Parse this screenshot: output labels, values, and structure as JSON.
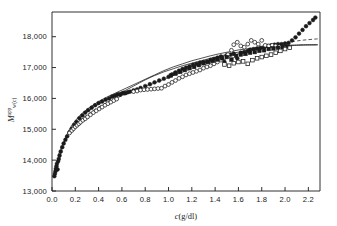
{
  "figure": {
    "background_color": "#ffffff",
    "ink_color": "#1a1a1a"
  },
  "chart_data": {
    "type": "scatter",
    "title": "",
    "subtitle": "",
    "xlabel": "c (g/dl)",
    "xlabel_italic_part": "c",
    "xlabel_rest": "(g/dl)",
    "ylabel": "M app w(c)",
    "ylabel_base": "M",
    "ylabel_sup": "app",
    "ylabel_sub": "w(c)",
    "xlim": [
      0.0,
      2.3
    ],
    "ylim": [
      13000,
      18800
    ],
    "grid": false,
    "legend_position": "none",
    "xticks": [
      "0.0",
      "0.2",
      "0.4",
      "0.6",
      "0.8",
      "1.0",
      "1.2",
      "1.4",
      "1.6",
      "1.8",
      "2.0",
      "2.2"
    ],
    "xtick_values": [
      0.0,
      0.2,
      0.4,
      0.6,
      0.8,
      1.0,
      1.2,
      1.4,
      1.6,
      1.8,
      2.0,
      2.2
    ],
    "yticks": [
      "13,000",
      "14,000",
      "15,000",
      "16,000",
      "17,000",
      "18,000"
    ],
    "ytick_values": [
      13000,
      14000,
      15000,
      16000,
      17000,
      18000
    ],
    "series": [
      {
        "name": "filled-circles",
        "marker": "filled-circle",
        "color": "#1a1a1a",
        "points": [
          [
            0.02,
            13480
          ],
          [
            0.025,
            13560
          ],
          [
            0.03,
            13640
          ],
          [
            0.033,
            13720
          ],
          [
            0.038,
            13800
          ],
          [
            0.042,
            13880
          ],
          [
            0.048,
            13700
          ],
          [
            0.052,
            13960
          ],
          [
            0.058,
            14040
          ],
          [
            0.065,
            14150
          ],
          [
            0.075,
            14280
          ],
          [
            0.088,
            14420
          ],
          [
            0.1,
            14540
          ],
          [
            0.115,
            14660
          ],
          [
            0.13,
            14770
          ],
          [
            0.15,
            14900
          ],
          [
            0.17,
            15020
          ],
          [
            0.19,
            15140
          ],
          [
            0.21,
            15240
          ],
          [
            0.235,
            15360
          ],
          [
            0.26,
            15450
          ],
          [
            0.285,
            15540
          ],
          [
            0.31,
            15620
          ],
          [
            0.34,
            15700
          ],
          [
            0.37,
            15780
          ],
          [
            0.4,
            15850
          ],
          [
            0.43,
            15900
          ],
          [
            0.46,
            15960
          ],
          [
            0.49,
            16000
          ],
          [
            0.515,
            16060
          ],
          [
            0.535,
            16080
          ],
          [
            0.555,
            16110
          ],
          [
            0.57,
            16140
          ],
          [
            0.585,
            16120
          ],
          [
            0.6,
            16160
          ],
          [
            0.615,
            16180
          ],
          [
            0.63,
            16170
          ],
          [
            0.65,
            16200
          ],
          [
            0.67,
            16220
          ],
          [
            0.7,
            16260
          ],
          [
            0.73,
            16290
          ],
          [
            0.76,
            16340
          ],
          [
            0.8,
            16400
          ],
          [
            0.84,
            16460
          ],
          [
            0.88,
            16520
          ],
          [
            0.92,
            16580
          ],
          [
            0.96,
            16640
          ],
          [
            1.0,
            16700
          ],
          [
            1.03,
            16780
          ],
          [
            1.06,
            16840
          ],
          [
            1.09,
            16900
          ],
          [
            1.12,
            16960
          ],
          [
            1.15,
            17000
          ],
          [
            1.18,
            17040
          ],
          [
            1.21,
            17090
          ],
          [
            1.24,
            17120
          ],
          [
            1.27,
            17160
          ],
          [
            1.3,
            17180
          ],
          [
            1.33,
            17200
          ],
          [
            1.36,
            17250
          ],
          [
            1.39,
            17280
          ],
          [
            1.42,
            17320
          ],
          [
            1.45,
            17360
          ],
          [
            1.48,
            17180
          ],
          [
            1.5,
            17400
          ],
          [
            1.53,
            17420
          ],
          [
            1.56,
            17450
          ],
          [
            1.59,
            17300
          ],
          [
            1.62,
            17480
          ],
          [
            1.65,
            17500
          ],
          [
            1.68,
            17540
          ],
          [
            1.7,
            17580
          ],
          [
            1.73,
            17600
          ],
          [
            1.76,
            17620
          ],
          [
            1.79,
            17640
          ],
          [
            1.82,
            17660
          ],
          [
            1.85,
            17700
          ],
          [
            1.88,
            17720
          ],
          [
            1.91,
            17740
          ],
          [
            1.94,
            17760
          ],
          [
            1.97,
            17760
          ],
          [
            2.0,
            17780
          ],
          [
            2.03,
            17800
          ],
          [
            2.06,
            17880
          ],
          [
            2.09,
            17980
          ],
          [
            2.12,
            18100
          ],
          [
            2.15,
            18220
          ],
          [
            2.18,
            18340
          ],
          [
            2.21,
            18440
          ],
          [
            2.24,
            18540
          ],
          [
            2.26,
            18620
          ]
        ]
      },
      {
        "name": "open-circles",
        "marker": "open-circle",
        "color": "#1a1a1a",
        "points": [
          [
            0.15,
            14880
          ],
          [
            0.17,
            14960
          ],
          [
            0.185,
            15020
          ],
          [
            0.2,
            15080
          ],
          [
            0.215,
            15130
          ],
          [
            0.23,
            15180
          ],
          [
            0.245,
            15230
          ],
          [
            0.265,
            15290
          ],
          [
            0.285,
            15340
          ],
          [
            0.305,
            15400
          ],
          [
            0.33,
            15470
          ],
          [
            0.355,
            15540
          ],
          [
            0.38,
            15600
          ],
          [
            0.405,
            15660
          ],
          [
            0.43,
            15720
          ],
          [
            0.455,
            15780
          ],
          [
            0.48,
            15830
          ],
          [
            0.505,
            15880
          ],
          [
            0.53,
            15930
          ],
          [
            0.555,
            15980
          ],
          [
            0.7,
            16220
          ],
          [
            0.73,
            16240
          ],
          [
            0.76,
            16270
          ],
          [
            0.79,
            16280
          ],
          [
            0.82,
            16290
          ],
          [
            0.85,
            16300
          ],
          [
            0.88,
            16310
          ],
          [
            0.91,
            16320
          ],
          [
            0.94,
            16330
          ],
          [
            0.97,
            16400
          ],
          [
            1.0,
            16450
          ],
          [
            1.03,
            16520
          ],
          [
            1.06,
            16580
          ],
          [
            1.09,
            16650
          ],
          [
            1.12,
            16700
          ],
          [
            1.15,
            16760
          ],
          [
            1.18,
            16800
          ],
          [
            1.21,
            16840
          ],
          [
            1.24,
            16880
          ],
          [
            1.27,
            16920
          ],
          [
            1.3,
            16980
          ],
          [
            1.33,
            17020
          ],
          [
            1.36,
            17060
          ],
          [
            1.39,
            17120
          ],
          [
            1.42,
            17180
          ],
          [
            1.45,
            17240
          ],
          [
            1.48,
            17320
          ],
          [
            1.51,
            17420
          ],
          [
            1.54,
            17560
          ],
          [
            1.56,
            17740
          ],
          [
            1.59,
            17820
          ],
          [
            1.62,
            17700
          ],
          [
            1.65,
            17660
          ],
          [
            1.68,
            17760
          ],
          [
            1.71,
            17880
          ],
          [
            1.74,
            17820
          ],
          [
            1.77,
            17760
          ],
          [
            1.8,
            17880
          ],
          [
            1.83,
            17720
          ],
          [
            1.86,
            17700
          ],
          [
            1.89,
            17720
          ],
          [
            1.92,
            17700
          ],
          [
            1.95,
            17680
          ]
        ]
      },
      {
        "name": "filled-squares",
        "marker": "filled-square",
        "color": "#1a1a1a",
        "points": [
          [
            1.02,
            16740
          ],
          [
            1.06,
            16800
          ],
          [
            1.1,
            16860
          ],
          [
            1.14,
            16920
          ],
          [
            1.18,
            16980
          ],
          [
            1.22,
            17020
          ],
          [
            1.26,
            17080
          ],
          [
            1.3,
            17140
          ],
          [
            1.34,
            17180
          ],
          [
            1.38,
            17220
          ],
          [
            1.42,
            17260
          ],
          [
            1.46,
            17300
          ],
          [
            1.5,
            17340
          ],
          [
            1.54,
            17260
          ],
          [
            1.58,
            17380
          ],
          [
            1.62,
            17420
          ],
          [
            1.66,
            17440
          ],
          [
            1.7,
            17480
          ],
          [
            1.74,
            17500
          ],
          [
            1.78,
            17540
          ],
          [
            1.82,
            17560
          ],
          [
            1.86,
            17600
          ],
          [
            1.9,
            17620
          ],
          [
            1.94,
            17640
          ],
          [
            1.98,
            17660
          ],
          [
            2.02,
            17680
          ]
        ]
      },
      {
        "name": "open-squares",
        "marker": "open-square",
        "color": "#1a1a1a",
        "points": [
          [
            1.48,
            17100
          ],
          [
            1.52,
            17060
          ],
          [
            1.56,
            17140
          ],
          [
            1.6,
            17180
          ],
          [
            1.64,
            17200
          ],
          [
            1.68,
            17120
          ],
          [
            1.72,
            17240
          ],
          [
            1.76,
            17300
          ],
          [
            1.8,
            17340
          ],
          [
            1.84,
            17380
          ],
          [
            1.88,
            17420
          ],
          [
            1.92,
            17480
          ],
          [
            1.96,
            17540
          ],
          [
            2.0,
            17600
          ],
          [
            2.04,
            17640
          ]
        ]
      }
    ],
    "curves": [
      {
        "name": "solid-theory-curve",
        "style": "solid",
        "color": "#1a1a1a",
        "points": [
          [
            0.06,
            13980
          ],
          [
            0.1,
            14560
          ],
          [
            0.15,
            15000
          ],
          [
            0.2,
            15280
          ],
          [
            0.26,
            15520
          ],
          [
            0.32,
            15700
          ],
          [
            0.4,
            15900
          ],
          [
            0.48,
            16060
          ],
          [
            0.56,
            16200
          ],
          [
            0.64,
            16340
          ],
          [
            0.72,
            16480
          ],
          [
            0.8,
            16620
          ],
          [
            0.88,
            16760
          ],
          [
            0.96,
            16900
          ],
          [
            1.04,
            17020
          ],
          [
            1.12,
            17120
          ],
          [
            1.2,
            17220
          ],
          [
            1.28,
            17300
          ],
          [
            1.36,
            17380
          ],
          [
            1.44,
            17450
          ],
          [
            1.52,
            17510
          ],
          [
            1.6,
            17570
          ],
          [
            1.68,
            17610
          ],
          [
            1.76,
            17650
          ],
          [
            1.84,
            17680
          ],
          [
            1.92,
            17700
          ],
          [
            2.0,
            17720
          ],
          [
            2.08,
            17730
          ],
          [
            2.16,
            17740
          ],
          [
            2.28,
            17745
          ]
        ]
      },
      {
        "name": "dashed-theory-curve",
        "style": "dashed",
        "color": "#1a1a1a",
        "points": [
          [
            0.055,
            14180
          ],
          [
            0.1,
            14560
          ],
          [
            0.15,
            14880
          ],
          [
            0.2,
            15120
          ],
          [
            0.26,
            15340
          ],
          [
            0.32,
            15520
          ],
          [
            0.4,
            15720
          ],
          [
            0.48,
            15880
          ],
          [
            0.56,
            16020
          ],
          [
            0.64,
            16140
          ],
          [
            0.72,
            16260
          ],
          [
            0.8,
            16380
          ],
          [
            0.88,
            16500
          ],
          [
            0.96,
            16620
          ],
          [
            1.04,
            16740
          ],
          [
            1.12,
            16850
          ],
          [
            1.2,
            16960
          ],
          [
            1.28,
            17060
          ],
          [
            1.36,
            17160
          ],
          [
            1.44,
            17260
          ],
          [
            1.52,
            17350
          ],
          [
            1.6,
            17440
          ],
          [
            1.68,
            17520
          ],
          [
            1.76,
            17600
          ],
          [
            1.84,
            17680
          ],
          [
            1.92,
            17740
          ],
          [
            2.0,
            17800
          ],
          [
            2.08,
            17850
          ],
          [
            2.16,
            17890
          ],
          [
            2.28,
            17930
          ]
        ]
      },
      {
        "name": "secondary-solid-curve",
        "style": "solid",
        "color": "#1a1a1a",
        "points": [
          [
            0.3,
            15560
          ],
          [
            0.4,
            15820
          ],
          [
            0.5,
            16020
          ],
          [
            0.6,
            16200
          ],
          [
            0.7,
            16400
          ],
          [
            0.8,
            16600
          ],
          [
            0.88,
            16740
          ],
          [
            0.96,
            16860
          ],
          [
            1.04,
            16960
          ],
          [
            1.12,
            17060
          ],
          [
            1.2,
            17140
          ],
          [
            1.28,
            17220
          ],
          [
            1.36,
            17300
          ],
          [
            1.44,
            17370
          ],
          [
            1.52,
            17440
          ],
          [
            1.6,
            17500
          ],
          [
            1.68,
            17560
          ],
          [
            1.76,
            17610
          ],
          [
            1.84,
            17650
          ],
          [
            1.92,
            17680
          ],
          [
            2.0,
            17700
          ],
          [
            2.08,
            17715
          ],
          [
            2.16,
            17725
          ],
          [
            2.28,
            17730
          ]
        ]
      }
    ]
  }
}
